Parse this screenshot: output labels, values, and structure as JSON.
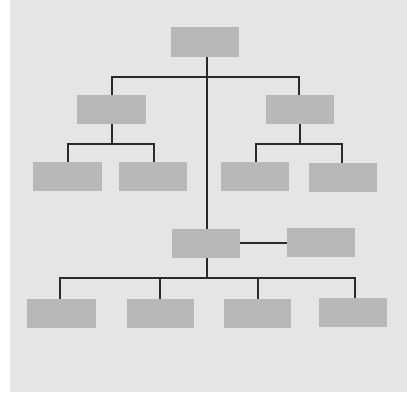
{
  "diagram": {
    "type": "org-chart",
    "colors": {
      "background": "#e5e5e3",
      "box": "#b8b8b6",
      "line": "#2a2a2a",
      "page": "#ffffff"
    },
    "panel": {
      "x": 10,
      "y": 0,
      "w": 397,
      "h": 392
    },
    "nodes": [
      {
        "id": "root",
        "x": 171,
        "y": 27,
        "w": 68,
        "h": 30,
        "level": 0
      },
      {
        "id": "left-mgr",
        "x": 77,
        "y": 95,
        "w": 69,
        "h": 29,
        "level": 1
      },
      {
        "id": "right-mgr",
        "x": 266,
        "y": 95,
        "w": 68,
        "h": 29,
        "level": 1
      },
      {
        "id": "left-sub-1",
        "x": 33,
        "y": 162,
        "w": 69,
        "h": 29,
        "level": 2
      },
      {
        "id": "left-sub-2",
        "x": 119,
        "y": 162,
        "w": 68,
        "h": 29,
        "level": 2
      },
      {
        "id": "right-sub-1",
        "x": 221,
        "y": 162,
        "w": 68,
        "h": 29,
        "level": 2
      },
      {
        "id": "right-sub-2",
        "x": 309,
        "y": 163,
        "w": 68,
        "h": 29,
        "level": 2
      },
      {
        "id": "center-mgr",
        "x": 172,
        "y": 229,
        "w": 68,
        "h": 29,
        "level": 1
      },
      {
        "id": "assistant",
        "x": 287,
        "y": 228,
        "w": 68,
        "h": 29,
        "level": 1
      },
      {
        "id": "bottom-1",
        "x": 27,
        "y": 299,
        "w": 69,
        "h": 29,
        "level": 2
      },
      {
        "id": "bottom-2",
        "x": 127,
        "y": 299,
        "w": 67,
        "h": 29,
        "level": 2
      },
      {
        "id": "bottom-3",
        "x": 224,
        "y": 299,
        "w": 67,
        "h": 29,
        "level": 2
      },
      {
        "id": "bottom-4",
        "x": 319,
        "y": 298,
        "w": 68,
        "h": 29,
        "level": 2
      }
    ],
    "lines": [
      {
        "id": "trunk",
        "x": 206,
        "y": 57,
        "w": 2,
        "h": 172
      },
      {
        "id": "l1-bus",
        "x": 111,
        "y": 76,
        "w": 189,
        "h": 2
      },
      {
        "id": "l1-drop-left",
        "x": 111,
        "y": 76,
        "w": 2,
        "h": 19
      },
      {
        "id": "l1-drop-right",
        "x": 298,
        "y": 76,
        "w": 2,
        "h": 19
      },
      {
        "id": "left-stem",
        "x": 111,
        "y": 124,
        "w": 2,
        "h": 19
      },
      {
        "id": "left-bus",
        "x": 67,
        "y": 143,
        "w": 88,
        "h": 2
      },
      {
        "id": "left-drop-1",
        "x": 67,
        "y": 143,
        "w": 2,
        "h": 19
      },
      {
        "id": "left-drop-2",
        "x": 153,
        "y": 143,
        "w": 2,
        "h": 19
      },
      {
        "id": "right-stem",
        "x": 299,
        "y": 124,
        "w": 2,
        "h": 19
      },
      {
        "id": "right-bus",
        "x": 255,
        "y": 143,
        "w": 88,
        "h": 2
      },
      {
        "id": "right-drop-1",
        "x": 255,
        "y": 143,
        "w": 2,
        "h": 19
      },
      {
        "id": "right-drop-2",
        "x": 341,
        "y": 143,
        "w": 2,
        "h": 20
      },
      {
        "id": "assistant-link",
        "x": 240,
        "y": 242,
        "w": 47,
        "h": 2
      },
      {
        "id": "center-stem",
        "x": 206,
        "y": 258,
        "w": 2,
        "h": 20
      },
      {
        "id": "bottom-bus",
        "x": 59,
        "y": 277,
        "w": 297,
        "h": 2
      },
      {
        "id": "bottom-drop-1",
        "x": 59,
        "y": 277,
        "w": 2,
        "h": 22
      },
      {
        "id": "bottom-drop-2",
        "x": 159,
        "y": 277,
        "w": 2,
        "h": 22
      },
      {
        "id": "bottom-drop-3",
        "x": 257,
        "y": 277,
        "w": 2,
        "h": 22
      },
      {
        "id": "bottom-drop-4",
        "x": 354,
        "y": 277,
        "w": 2,
        "h": 21
      }
    ]
  }
}
